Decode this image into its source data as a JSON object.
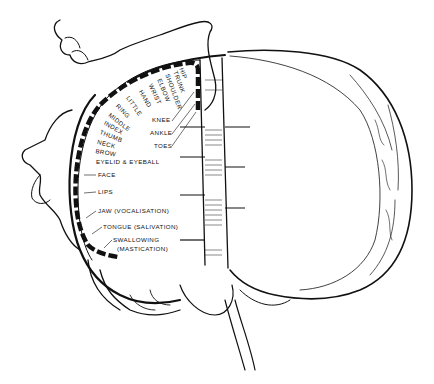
{
  "diagram": {
    "type": "motor-homunculus",
    "labels": {
      "hip": "Hip",
      "trunk": "Trunk",
      "shoulder": "Shoulder",
      "elbow": "Elbow",
      "wrist": "Wrist",
      "hand": "Hand",
      "little": "Little",
      "ring": "Ring",
      "middle": "Middle",
      "index": "Index",
      "thumb": "Thumb",
      "neck": "Neck",
      "brow": "Brow",
      "eyelid_eyeball": "Eyelid & Eyeball",
      "face": "Face",
      "lips": "Lips",
      "jaw": "Jaw (Vocalisation)",
      "tongue": "Tongue (Salivation)",
      "swallowing": "Swallowing",
      "mastication": "(Mastication)",
      "knee": "Knee",
      "ankle": "Ankle",
      "toes": "Toes"
    },
    "colors": {
      "ink": "#111111",
      "background": "#ffffff"
    }
  }
}
